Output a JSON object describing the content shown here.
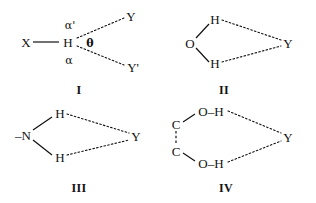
{
  "figure": {
    "background_color": "#ffffff",
    "ink_color": "#111111"
  },
  "panels": [
    {
      "id": "I",
      "label": "I",
      "description": "Bifurcated hydrogen bond from X-H donor to two acceptors Y and Y prime",
      "atoms": [
        {
          "name": "X",
          "text": "X"
        },
        {
          "name": "H",
          "text": "H"
        },
        {
          "name": "Y",
          "text": "Y"
        },
        {
          "name": "Yprime",
          "text": "Y'"
        }
      ],
      "annotations": [
        {
          "name": "alpha-prime",
          "text": "α'"
        },
        {
          "name": "alpha",
          "text": "α"
        },
        {
          "name": "theta",
          "text": "θ"
        }
      ],
      "bonds": [
        {
          "name": "X-H",
          "style": "solid"
        },
        {
          "name": "H...Y",
          "style": "dotted"
        },
        {
          "name": "H...Yprime",
          "style": "dotted"
        }
      ]
    },
    {
      "id": "II",
      "label": "II",
      "description": "Water oxygen with two hydrogens both hydrogen bonded to acceptor Y",
      "atoms": [
        {
          "name": "O",
          "text": "O"
        },
        {
          "name": "H-top",
          "text": "H"
        },
        {
          "name": "H-bottom",
          "text": "H"
        },
        {
          "name": "Y",
          "text": "Y"
        }
      ],
      "bonds": [
        {
          "name": "O-H-top",
          "style": "solid"
        },
        {
          "name": "O-H-bottom",
          "style": "solid"
        },
        {
          "name": "H-top...Y",
          "style": "dotted"
        },
        {
          "name": "H-bottom...Y",
          "style": "dotted"
        }
      ]
    },
    {
      "id": "III",
      "label": "III",
      "description": "Amine nitrogen with two hydrogens both hydrogen bonded to acceptor Y",
      "atoms": [
        {
          "name": "N",
          "text": "–N"
        },
        {
          "name": "H-top",
          "text": "H"
        },
        {
          "name": "H-bottom",
          "text": "H"
        },
        {
          "name": "Y",
          "text": "Y"
        }
      ],
      "bonds": [
        {
          "name": "N-H-top",
          "style": "solid"
        },
        {
          "name": "N-H-bottom",
          "style": "solid"
        },
        {
          "name": "H-top...Y",
          "style": "dotted"
        },
        {
          "name": "H-bottom...Y",
          "style": "dotted"
        }
      ]
    },
    {
      "id": "IV",
      "label": "IV",
      "description": "Diol with two carbons each bearing an O-H group hydrogen bonded to acceptor Y",
      "atoms": [
        {
          "name": "C-top",
          "text": "C"
        },
        {
          "name": "C-bottom",
          "text": "C"
        },
        {
          "name": "OH-top",
          "text": "O–H"
        },
        {
          "name": "OH-bottom",
          "text": "O–H"
        },
        {
          "name": "Y",
          "text": "Y"
        }
      ],
      "bonds": [
        {
          "name": "C-C",
          "style": "dashed"
        },
        {
          "name": "C-top-O-top",
          "style": "solid"
        },
        {
          "name": "C-bottom-O-bottom",
          "style": "solid"
        },
        {
          "name": "OH-top...Y",
          "style": "dotted"
        },
        {
          "name": "OH-bottom...Y",
          "style": "dotted"
        }
      ]
    }
  ]
}
